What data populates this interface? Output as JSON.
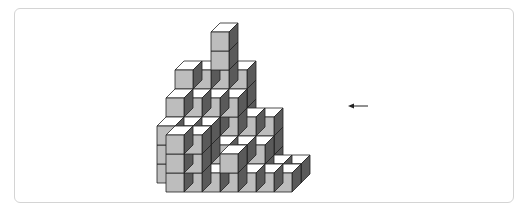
{
  "figure": {
    "colors": {
      "front": "#bdbdbd",
      "top": "#ffffff",
      "side": "#5a5a5a",
      "stroke": "#222222",
      "border": "#d4d4d4"
    },
    "projection": {
      "origin_x": 184,
      "origin_y": 173,
      "unit_w": 18,
      "unit_h": 19,
      "depth_dx": 9,
      "depth_dy": -9
    },
    "heightmap_rows_back_to_front": [
      {
        "j": 3,
        "cells": [
          [
            -2,
            5
          ],
          [
            -1,
            5
          ],
          [
            0,
            7
          ],
          [
            1,
            5
          ]
        ]
      },
      {
        "j": 2,
        "cells": [
          [
            -2,
            4
          ],
          [
            -1,
            4
          ],
          [
            0,
            4
          ],
          [
            1,
            4
          ],
          [
            2,
            3
          ],
          [
            3,
            3
          ]
        ]
      },
      {
        "j": 1,
        "cells": [
          [
            -2,
            3
          ],
          [
            -1,
            3
          ],
          [
            0,
            3
          ],
          [
            1,
            2
          ],
          [
            2,
            2
          ],
          [
            3,
            2
          ],
          [
            4,
            1
          ],
          [
            5,
            1
          ]
        ]
      },
      {
        "j": 0,
        "cells": [
          [
            -1,
            3
          ],
          [
            0,
            3
          ],
          [
            1,
            1
          ],
          [
            2,
            2
          ],
          [
            3,
            1
          ],
          [
            4,
            1
          ],
          [
            5,
            1
          ]
        ]
      }
    ],
    "arrow": {
      "x1": 368,
      "y1": 106,
      "x2": 348,
      "y2": 106,
      "direction": "left",
      "label": ""
    }
  }
}
